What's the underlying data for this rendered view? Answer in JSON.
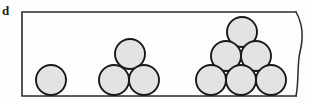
{
  "figure": {
    "panel_label": "d",
    "label_name": "panel-label-d",
    "canvas": {
      "width": 310,
      "height": 104
    },
    "background_color": "#fdfdfd"
  },
  "frame": {
    "name": "figure-frame",
    "left": 22,
    "top": 12,
    "right": 296,
    "bottom": 96,
    "stroke_color": "#2b2b2b",
    "stroke_width": 1.6,
    "right_edge_style": "torn-wavy-break",
    "torn_edge_path": "M 296 12 C 304 26, 303 40, 300 52 C 297 64, 299 82, 296 96"
  },
  "circle_style": {
    "fill_color": "#e3e3e3",
    "stroke_color": "#191919",
    "stroke_width": 1.9,
    "radius": 15
  },
  "chart_data": {
    "type": "scatter",
    "title": "",
    "xlabel": "",
    "ylabel": "",
    "groups": [
      {
        "name": "cluster-1",
        "count": 1,
        "rows": 1,
        "circles": [
          {
            "name": "circle-g1-r1-c1",
            "cx": 51,
            "cy": 80,
            "r": 15
          }
        ]
      },
      {
        "name": "cluster-3",
        "count": 3,
        "rows": 2,
        "circles": [
          {
            "name": "circle-g2-r1-c1",
            "cx": 130,
            "cy": 54,
            "r": 15
          },
          {
            "name": "circle-g2-r2-c1",
            "cx": 114,
            "cy": 80,
            "r": 15
          },
          {
            "name": "circle-g2-r2-c2",
            "cx": 144,
            "cy": 80,
            "r": 15
          }
        ]
      },
      {
        "name": "cluster-6",
        "count": 6,
        "rows": 3,
        "circles": [
          {
            "name": "circle-g3-r1-c1",
            "cx": 242,
            "cy": 32,
            "r": 15
          },
          {
            "name": "circle-g3-r2-c1",
            "cx": 226,
            "cy": 56,
            "r": 15
          },
          {
            "name": "circle-g3-r2-c2",
            "cx": 256,
            "cy": 56,
            "r": 15
          },
          {
            "name": "circle-g3-r3-c1",
            "cx": 211,
            "cy": 80,
            "r": 15
          },
          {
            "name": "circle-g3-r3-c2",
            "cx": 241,
            "cy": 80,
            "r": 15
          },
          {
            "name": "circle-g3-r3-c3",
            "cx": 271,
            "cy": 80,
            "r": 15
          }
        ]
      }
    ]
  }
}
